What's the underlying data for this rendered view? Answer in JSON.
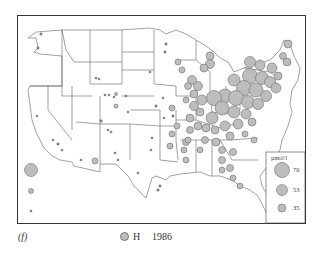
{
  "figure": {
    "panel_label": "(f)",
    "species_label": "H",
    "year": "1986",
    "symbol_color": "#bdbdbd",
    "symbol_stroke": "#6f6f6f"
  },
  "legend": {
    "unit": "µmol/l",
    "entries": [
      {
        "value": "70",
        "r": 7.5
      },
      {
        "value": "53",
        "r": 5.5
      },
      {
        "value": "35",
        "r": 4
      }
    ]
  },
  "inset_symbols": [
    {
      "label": "Alaska/Hawaii inset large",
      "r": 6.5
    },
    {
      "label": "inset medium",
      "r": 2.5
    },
    {
      "label": "inset small",
      "r": 1
    }
  ]
}
